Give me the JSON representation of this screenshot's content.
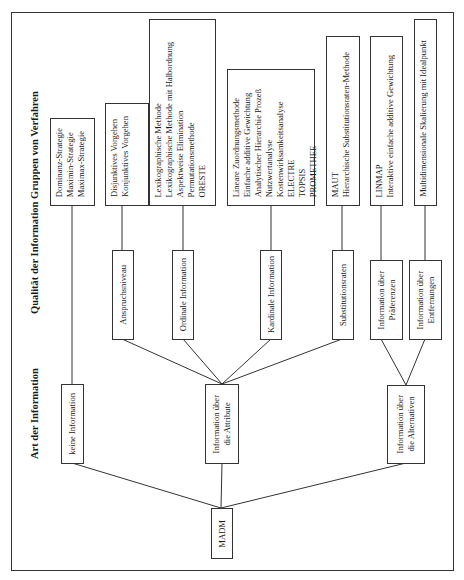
{
  "headers": {
    "groups": "Gruppen von Verfahren",
    "quality": "Qualität der Information",
    "kind": "Art der Information"
  },
  "root": {
    "label": "MADM"
  },
  "kind_nodes": {
    "none": "keine Information",
    "attributes": [
      "Information über",
      "die Attribute"
    ],
    "alternatives": [
      "Information über",
      "die Alternativen"
    ]
  },
  "quality_nodes": {
    "aspiration": "Anspruchsniveau",
    "ordinal": "Ordinale Information",
    "cardinal": "Kardinale Information",
    "substitution": "Substitutionsraten",
    "preferences": [
      "Information über",
      "Präferenzen"
    ],
    "distances": [
      "Information über",
      "Entfernungen"
    ]
  },
  "method_groups": {
    "no_info": [
      "Dominanz-Strategie",
      "Maximin-Strategie",
      "Maximax-Strategie"
    ],
    "aspiration": [
      "Disjunktives Vorgehen",
      "Konjunktives Vorgehen"
    ],
    "ordinal": [
      "Lexikographische Methode",
      "Lexikographische Methode mit Halbordnung",
      "Aspektweise Elimination",
      "Permutationsmethode",
      "ORESTE"
    ],
    "cardinal": [
      "Lineare Zuordnungsmethode",
      "Einfache additive Gewichtung",
      "Analytischer Hierarchie Prozeß",
      "Nutzwertanalyse",
      "Kostenwirksamkeitsanalyse",
      "ELECTRE",
      "TOPSIS",
      "PROMETHEE"
    ],
    "substitution": [
      "MAUT",
      "Hierarchische Substitutionsraten-Methode"
    ],
    "preferences": [
      "LINMAP",
      "Interaktive einfache additive Gewichtung"
    ],
    "distances": [
      "Multidimensionale Skalierung mit Idealpunkt"
    ]
  }
}
